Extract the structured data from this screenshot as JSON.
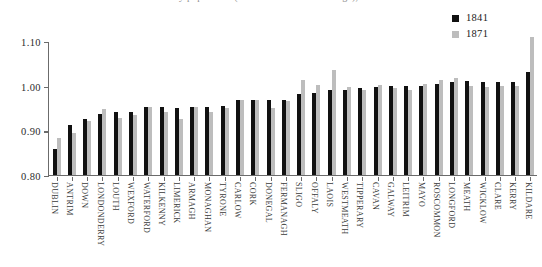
{
  "title": "Ratio of county population (relative to national average), 1841 and 1871",
  "legend": {
    "position": "top-right",
    "entries": [
      {
        "label": "1841",
        "color": "#111111",
        "icon": "legend-square-black"
      },
      {
        "label": "1871",
        "color": "#bdbdbd",
        "icon": "legend-square-grey"
      }
    ]
  },
  "axes": {
    "y_ticks": [
      "0.80",
      "0.90",
      "1.00",
      "1.10"
    ],
    "y_tick_values": [
      0.8,
      0.9,
      1.0,
      1.1
    ],
    "ylim": [
      0.8,
      1.1
    ],
    "xlabel": "",
    "ylabel": "",
    "grid": false
  },
  "chart_data": {
    "type": "bar",
    "title": "Ratio of county population (relative to national average), 1841 and 1871",
    "xlabel": "",
    "ylabel": "",
    "ylim": [
      0.8,
      1.1
    ],
    "grid": false,
    "legend_position": "top-right",
    "categories": [
      "DUBLIN",
      "ANTRIM",
      "DOWN",
      "LONDONDERRY",
      "LOUTH",
      "WEXFORD",
      "WATERFORD",
      "KILKENNY",
      "LIMERICK",
      "ARMAGH",
      "MONAGHAN",
      "TYRONE",
      "CARLOW",
      "CORK",
      "DONEGAL",
      "FERMANAGH",
      "SLIGO",
      "OFFALY",
      "LAOIS",
      "WESTMEATH",
      "TIPPERARY",
      "CAVAN",
      "GALWAY",
      "LEITRIM",
      "MAYO",
      "ROSCOMMON",
      "LONGFORD",
      "MEATH",
      "WICKLOW",
      "CLARE",
      "KERRY",
      "KILDARE"
    ],
    "series": [
      {
        "name": "1841",
        "color": "#111111",
        "values": [
          0.858,
          0.913,
          0.925,
          0.936,
          0.941,
          0.941,
          0.952,
          0.952,
          0.951,
          0.952,
          0.953,
          0.955,
          0.968,
          0.968,
          0.968,
          0.969,
          0.982,
          0.984,
          0.991,
          0.991,
          0.995,
          0.996,
          1.0,
          1.0,
          1.0,
          1.004,
          1.008,
          1.01,
          1.009,
          1.009,
          1.008,
          1.031
        ]
      },
      {
        "name": "1871",
        "color": "#bdbdbd",
        "values": [
          0.882,
          0.893,
          0.922,
          0.947,
          0.927,
          0.935,
          0.952,
          0.941,
          0.926,
          0.952,
          0.94,
          0.951,
          0.968,
          0.967,
          0.951,
          0.965,
          1.013,
          1.002,
          1.034,
          0.997,
          0.991,
          1.001,
          0.995,
          0.991,
          1.003,
          1.013,
          1.018,
          1.0,
          0.998,
          1.0,
          0.999,
          1.108
        ]
      }
    ]
  }
}
